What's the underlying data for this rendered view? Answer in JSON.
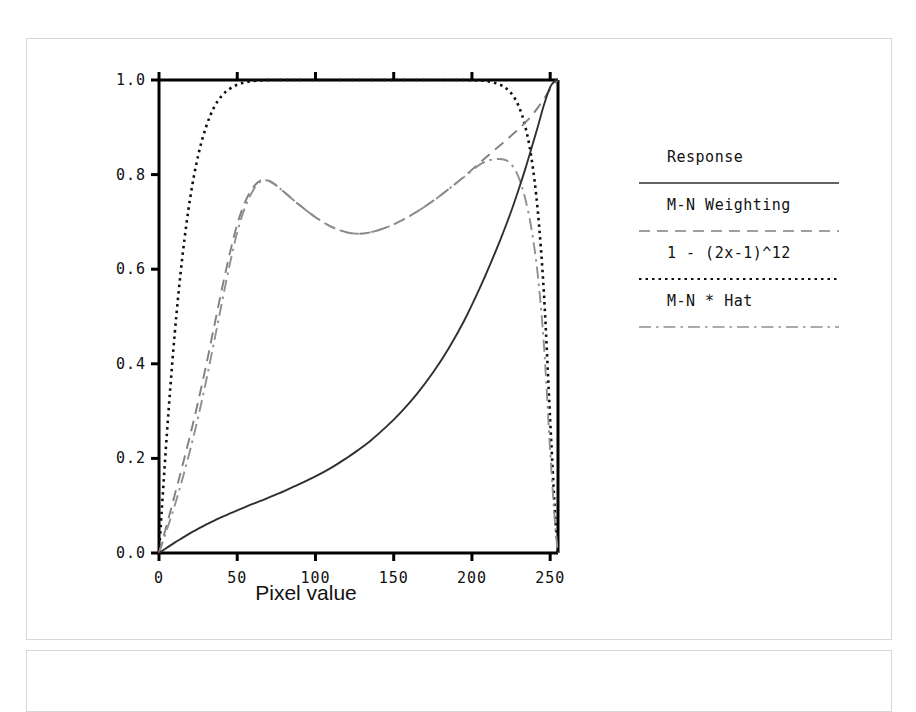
{
  "figure": {
    "background_color": "#ffffff",
    "frame_color": "#d8d8d8",
    "axis_color": "#000000"
  },
  "axes": {
    "x_title": "Pixel value",
    "x_ticks": [
      "0",
      "50",
      "100",
      "150",
      "200",
      "250"
    ],
    "x_tick_values": [
      0,
      50,
      100,
      150,
      200,
      250
    ],
    "y_ticks": [
      "0.0",
      "0.2",
      "0.4",
      "0.6",
      "0.8",
      "1.0"
    ],
    "y_tick_values": [
      0.0,
      0.2,
      0.4,
      0.6,
      0.8,
      1.0
    ]
  },
  "legend": {
    "entries": [
      {
        "label": "Response",
        "dash": "solid",
        "color": "#303030"
      },
      {
        "label": "M-N Weighting",
        "dash": "dashed",
        "color": "#808080"
      },
      {
        "label": "1 - (2x-1)^12",
        "dash": "dotted",
        "color": "#101010"
      },
      {
        "label": "M-N * Hat",
        "dash": "dashdot",
        "color": "#909090"
      }
    ]
  },
  "chart_data": {
    "type": "line",
    "title": "",
    "xlabel": "Pixel value",
    "ylabel": "",
    "xlim": [
      0,
      255
    ],
    "ylim": [
      0.0,
      1.0
    ],
    "grid": false,
    "legend_position": "right",
    "x": [
      0,
      5,
      10,
      15,
      20,
      25,
      30,
      35,
      40,
      45,
      50,
      55,
      60,
      65,
      70,
      75,
      80,
      90,
      100,
      110,
      120,
      127,
      135,
      145,
      155,
      165,
      175,
      185,
      195,
      205,
      212,
      218,
      222,
      226,
      230,
      234,
      238,
      242,
      246,
      250,
      253,
      255
    ],
    "series": [
      {
        "name": "Response",
        "dash": "solid",
        "color": "#303030",
        "values": [
          0.0,
          0.011,
          0.022,
          0.032,
          0.042,
          0.051,
          0.06,
          0.068,
          0.076,
          0.083,
          0.09,
          0.097,
          0.104,
          0.11,
          0.117,
          0.124,
          0.131,
          0.146,
          0.162,
          0.18,
          0.201,
          0.217,
          0.237,
          0.266,
          0.299,
          0.337,
          0.381,
          0.432,
          0.491,
          0.56,
          0.613,
          0.661,
          0.695,
          0.731,
          0.77,
          0.811,
          0.855,
          0.9,
          0.947,
          0.985,
          0.998,
          1.0
        ]
      },
      {
        "name": "M-N Weighting",
        "dash": "dashed",
        "color": "#808080",
        "values": [
          0.0,
          0.06,
          0.122,
          0.185,
          0.25,
          0.32,
          0.395,
          0.475,
          0.555,
          0.63,
          0.695,
          0.742,
          0.772,
          0.788,
          0.787,
          0.777,
          0.763,
          0.735,
          0.71,
          0.69,
          0.678,
          0.675,
          0.678,
          0.688,
          0.703,
          0.722,
          0.744,
          0.769,
          0.796,
          0.825,
          0.845,
          0.862,
          0.873,
          0.885,
          0.897,
          0.91,
          0.924,
          0.941,
          0.96,
          0.981,
          0.994,
          1.0
        ]
      },
      {
        "name": "1 - (2x-1)^12",
        "dash": "dotted",
        "color": "#101010",
        "values": [
          0.0,
          0.25,
          0.462,
          0.628,
          0.752,
          0.84,
          0.9,
          0.941,
          0.966,
          0.981,
          0.99,
          0.995,
          0.998,
          0.999,
          1.0,
          1.0,
          1.0,
          1.0,
          1.0,
          1.0,
          1.0,
          1.0,
          1.0,
          1.0,
          1.0,
          1.0,
          1.0,
          1.0,
          1.0,
          0.999,
          0.996,
          0.99,
          0.982,
          0.968,
          0.944,
          0.903,
          0.836,
          0.726,
          0.549,
          0.28,
          0.09,
          0.0
        ]
      },
      {
        "name": "M-N * Hat",
        "dash": "dashdot",
        "color": "#909090",
        "values": [
          0.0,
          0.049,
          0.1,
          0.157,
          0.219,
          0.287,
          0.362,
          0.443,
          0.526,
          0.607,
          0.678,
          0.731,
          0.766,
          0.786,
          0.787,
          0.777,
          0.763,
          0.735,
          0.71,
          0.69,
          0.678,
          0.675,
          0.678,
          0.688,
          0.703,
          0.722,
          0.744,
          0.769,
          0.795,
          0.821,
          0.831,
          0.833,
          0.83,
          0.818,
          0.793,
          0.75,
          0.686,
          0.59,
          0.44,
          0.215,
          0.068,
          0.0
        ]
      }
    ]
  }
}
